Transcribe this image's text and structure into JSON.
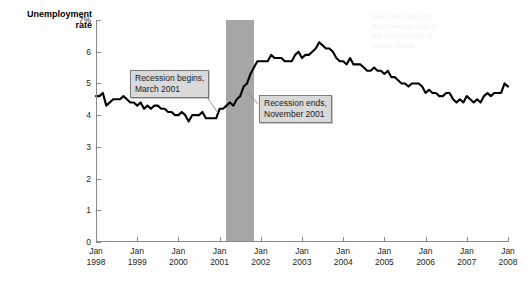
{
  "chart_data": {
    "type": "line",
    "title": "",
    "xlabel": "",
    "ylabel": "Unemployment rate",
    "ylim": [
      0,
      7
    ],
    "yticks": [
      0,
      1,
      2,
      3,
      4,
      5,
      6,
      7
    ],
    "ytick_labels": [
      "0",
      "1",
      "2",
      "3",
      "4",
      "5",
      "6",
      "7%"
    ],
    "xlim": [
      "Jan 1998",
      "Jan 2008"
    ],
    "xtick_labels": [
      "Jan\n1998",
      "Jan\n1999",
      "Jan\n2000",
      "Jan\n2001",
      "Jan\n2002",
      "Jan\n2003",
      "Jan\n2004",
      "Jan\n2005",
      "Jan\n2006",
      "Jan\n2007",
      "Jan\n2008"
    ],
    "grid": false,
    "legend": "none",
    "line_color": "#000000",
    "shading_color": "#a6a6a6",
    "annotations": [
      {
        "name": "recession-begins",
        "text": "Recession begins,\nMarch 2001",
        "points_to_x": "March 2001",
        "points_to_y": 4.3
      },
      {
        "name": "recession-ends",
        "text": "Recession ends,\nNovember 2001",
        "points_to_x": "November 2001",
        "points_to_y": 5.5
      }
    ],
    "shaded_regions": [
      {
        "name": "recession-2001",
        "from": "March 2001",
        "to": "November 2001",
        "label": "Recession"
      }
    ],
    "x": [
      "1998-01",
      "1998-02",
      "1998-03",
      "1998-04",
      "1998-05",
      "1998-06",
      "1998-07",
      "1998-08",
      "1998-09",
      "1998-10",
      "1998-11",
      "1998-12",
      "1999-01",
      "1999-02",
      "1999-03",
      "1999-04",
      "1999-05",
      "1999-06",
      "1999-07",
      "1999-08",
      "1999-09",
      "1999-10",
      "1999-11",
      "1999-12",
      "2000-01",
      "2000-02",
      "2000-03",
      "2000-04",
      "2000-05",
      "2000-06",
      "2000-07",
      "2000-08",
      "2000-09",
      "2000-10",
      "2000-11",
      "2000-12",
      "2001-01",
      "2001-02",
      "2001-03",
      "2001-04",
      "2001-05",
      "2001-06",
      "2001-07",
      "2001-08",
      "2001-09",
      "2001-10",
      "2001-11",
      "2001-12",
      "2002-01",
      "2002-02",
      "2002-03",
      "2002-04",
      "2002-05",
      "2002-06",
      "2002-07",
      "2002-08",
      "2002-09",
      "2002-10",
      "2002-11",
      "2002-12",
      "2003-01",
      "2003-02",
      "2003-03",
      "2003-04",
      "2003-05",
      "2003-06",
      "2003-07",
      "2003-08",
      "2003-09",
      "2003-10",
      "2003-11",
      "2003-12",
      "2004-01",
      "2004-02",
      "2004-03",
      "2004-04",
      "2004-05",
      "2004-06",
      "2004-07",
      "2004-08",
      "2004-09",
      "2004-10",
      "2004-11",
      "2004-12",
      "2005-01",
      "2005-02",
      "2005-03",
      "2005-04",
      "2005-05",
      "2005-06",
      "2005-07",
      "2005-08",
      "2005-09",
      "2005-10",
      "2005-11",
      "2005-12",
      "2006-01",
      "2006-02",
      "2006-03",
      "2006-04",
      "2006-05",
      "2006-06",
      "2006-07",
      "2006-08",
      "2006-09",
      "2006-10",
      "2006-11",
      "2006-12",
      "2007-01",
      "2007-02",
      "2007-03",
      "2007-04",
      "2007-05",
      "2007-06",
      "2007-07",
      "2007-08",
      "2007-09",
      "2007-10",
      "2007-11",
      "2007-12",
      "2008-01"
    ],
    "values": [
      4.6,
      4.6,
      4.7,
      4.3,
      4.4,
      4.5,
      4.5,
      4.5,
      4.6,
      4.5,
      4.4,
      4.4,
      4.3,
      4.4,
      4.2,
      4.3,
      4.2,
      4.3,
      4.3,
      4.2,
      4.2,
      4.1,
      4.1,
      4.0,
      4.0,
      4.1,
      4.0,
      3.8,
      4.0,
      4.0,
      4.0,
      4.1,
      3.9,
      3.9,
      3.9,
      3.9,
      4.2,
      4.2,
      4.3,
      4.4,
      4.3,
      4.5,
      4.6,
      4.9,
      5.0,
      5.3,
      5.5,
      5.7,
      5.7,
      5.7,
      5.7,
      5.9,
      5.8,
      5.8,
      5.8,
      5.7,
      5.7,
      5.7,
      5.9,
      6.0,
      5.8,
      5.9,
      5.9,
      6.0,
      6.1,
      6.3,
      6.2,
      6.1,
      6.1,
      6.0,
      5.8,
      5.7,
      5.7,
      5.6,
      5.8,
      5.6,
      5.6,
      5.6,
      5.5,
      5.4,
      5.4,
      5.5,
      5.4,
      5.4,
      5.3,
      5.4,
      5.2,
      5.2,
      5.1,
      5.0,
      5.0,
      4.9,
      5.0,
      5.0,
      5.0,
      4.9,
      4.7,
      4.8,
      4.7,
      4.7,
      4.6,
      4.6,
      4.7,
      4.7,
      4.5,
      4.4,
      4.5,
      4.4,
      4.6,
      4.5,
      4.4,
      4.5,
      4.4,
      4.6,
      4.7,
      4.6,
      4.7,
      4.7,
      4.7,
      5.0,
      4.9
    ]
  },
  "ghost_text": "bleed-through text\nfrom reverse side of\nthe printed page is\nfaintly visible"
}
